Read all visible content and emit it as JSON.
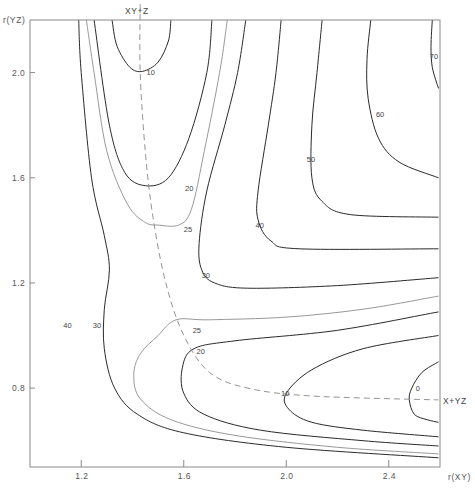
{
  "chart_data": {
    "type": "contour",
    "title": "",
    "xlabel": "r(XY)",
    "ylabel": "r(YZ)",
    "xlim": [
      1.0,
      2.6
    ],
    "ylim": [
      0.5,
      2.2
    ],
    "grid": false,
    "legend": null,
    "x_ticks": [
      {
        "value": 1.2,
        "label": "1.2"
      },
      {
        "value": 1.6,
        "label": "1.6"
      },
      {
        "value": 2.0,
        "label": "2.0"
      },
      {
        "value": 2.4,
        "label": "2.4"
      }
    ],
    "y_ticks": [
      {
        "value": 2.0,
        "label": "2.0"
      },
      {
        "value": 1.6,
        "label": "1.6"
      },
      {
        "value": 1.2,
        "label": "1.2"
      },
      {
        "value": 0.8,
        "label": "0.8"
      }
    ],
    "contour_levels": [
      0,
      10,
      20,
      25,
      30,
      40,
      50,
      60,
      70
    ],
    "contours": [
      {
        "level": "70",
        "style": "dark",
        "label_pos": [
          2.56,
          2.05
        ],
        "points": [
          [
            2.57,
            2.2
          ],
          [
            2.565,
            2.1
          ],
          [
            2.57,
            2.02
          ],
          [
            2.594,
            1.94
          ]
        ]
      },
      {
        "level": "60",
        "style": "dark",
        "label_pos": [
          2.35,
          1.83
        ],
        "points": [
          [
            2.33,
            2.2
          ],
          [
            2.315,
            2.05
          ],
          [
            2.32,
            1.9
          ],
          [
            2.36,
            1.75
          ],
          [
            2.44,
            1.66
          ],
          [
            2.594,
            1.6
          ]
        ]
      },
      {
        "level": "50",
        "style": "dark",
        "label_pos": [
          2.08,
          1.66
        ],
        "points": [
          [
            2.14,
            2.2
          ],
          [
            2.12,
            2.0
          ],
          [
            2.1,
            1.8
          ],
          [
            2.1,
            1.6
          ],
          [
            2.14,
            1.51
          ],
          [
            2.25,
            1.46
          ],
          [
            2.594,
            1.45
          ]
        ]
      },
      {
        "level": "40",
        "style": "dark",
        "label_pos": [
          1.88,
          1.41
        ],
        "points": [
          [
            1.98,
            2.2
          ],
          [
            1.96,
            2.0
          ],
          [
            1.93,
            1.8
          ],
          [
            1.89,
            1.55
          ],
          [
            1.89,
            1.44
          ],
          [
            1.94,
            1.36
          ],
          [
            2.05,
            1.33
          ],
          [
            2.594,
            1.33
          ]
        ]
      },
      {
        "level": "30",
        "style": "dark",
        "label_pos": [
          1.67,
          1.22
        ],
        "points": [
          [
            1.842,
            2.2
          ],
          [
            1.81,
            2.0
          ],
          [
            1.76,
            1.8
          ],
          [
            1.69,
            1.55
          ],
          [
            1.66,
            1.35
          ],
          [
            1.67,
            1.25
          ],
          [
            1.72,
            1.2
          ],
          [
            1.85,
            1.18
          ],
          [
            2.2,
            1.19
          ],
          [
            2.594,
            1.22
          ]
        ],
        "lower_branch": [
          [
            1.19,
            2.2
          ],
          [
            1.2,
            2.0
          ],
          [
            1.24,
            1.6
          ],
          [
            1.29,
            1.38
          ],
          [
            1.31,
            1.25
          ],
          [
            1.29,
            1.1
          ],
          [
            1.29,
            0.95
          ],
          [
            1.33,
            0.8
          ],
          [
            1.42,
            0.7
          ],
          [
            1.6,
            0.63
          ],
          [
            2.0,
            0.575
          ],
          [
            2.594,
            0.535
          ]
        ]
      },
      {
        "level": "25",
        "style": "light",
        "label_pos": [
          1.635,
          1.01
        ],
        "points": [
          [
            1.77,
            2.2
          ],
          [
            1.74,
            2.0
          ],
          [
            1.68,
            1.7
          ],
          [
            1.63,
            1.48
          ],
          [
            1.58,
            1.42
          ],
          [
            1.5,
            1.42
          ]
        ],
        "left_branch": [
          [
            1.22,
            2.2
          ],
          [
            1.25,
            2.0
          ],
          [
            1.3,
            1.7
          ],
          [
            1.38,
            1.5
          ],
          [
            1.45,
            1.43
          ],
          [
            1.5,
            1.42
          ]
        ],
        "lower_branch": [
          [
            2.594,
            1.15
          ],
          [
            2.3,
            1.1
          ],
          [
            2.0,
            1.07
          ],
          [
            1.7,
            1.06
          ],
          [
            1.57,
            1.06
          ],
          [
            1.5,
            1.0
          ],
          [
            1.43,
            0.93
          ],
          [
            1.405,
            0.85
          ],
          [
            1.43,
            0.76
          ],
          [
            1.55,
            0.68
          ],
          [
            1.8,
            0.62
          ],
          [
            2.2,
            0.575
          ],
          [
            2.594,
            0.55
          ]
        ]
      },
      {
        "level": "20",
        "style": "dark",
        "label_pos": [
          1.605,
          1.55
        ],
        "points": [
          [
            1.71,
            2.2
          ],
          [
            1.69,
            2.0
          ],
          [
            1.62,
            1.75
          ],
          [
            1.54,
            1.6
          ],
          [
            1.45,
            1.57
          ],
          [
            1.37,
            1.62
          ],
          [
            1.31,
            1.8
          ],
          [
            1.25,
            2.2
          ]
        ],
        "lower_branch": [
          [
            2.594,
            1.09
          ],
          [
            2.2,
            1.02
          ],
          [
            1.8,
            0.98
          ],
          [
            1.64,
            0.95
          ],
          [
            1.595,
            0.88
          ],
          [
            1.6,
            0.78
          ],
          [
            1.68,
            0.7
          ],
          [
            1.9,
            0.64
          ],
          [
            2.3,
            0.6
          ],
          [
            2.594,
            0.58
          ]
        ]
      },
      {
        "level": "10",
        "style": "dark",
        "label_pos": [
          1.455,
          1.99
        ],
        "points": [
          [
            1.32,
            2.2
          ],
          [
            1.34,
            2.1
          ],
          [
            1.39,
            2.02
          ],
          [
            1.44,
            2.005
          ],
          [
            1.5,
            2.04
          ],
          [
            1.54,
            2.12
          ],
          [
            1.55,
            2.2
          ]
        ],
        "lower_branch": [
          [
            2.594,
            1.0
          ],
          [
            2.3,
            0.95
          ],
          [
            2.1,
            0.87
          ],
          [
            2.0,
            0.78
          ],
          [
            2.01,
            0.72
          ],
          [
            2.1,
            0.67
          ],
          [
            2.3,
            0.64
          ],
          [
            2.594,
            0.615
          ]
        ]
      },
      {
        "level": "0",
        "style": "dark",
        "label_pos": [
          2.505,
          0.79
        ],
        "points": [
          [
            2.594,
            0.9
          ],
          [
            2.53,
            0.86
          ],
          [
            2.49,
            0.8
          ],
          [
            2.48,
            0.755
          ],
          [
            2.5,
            0.7
          ],
          [
            2.55,
            0.68
          ],
          [
            2.594,
            0.67
          ]
        ]
      }
    ],
    "reaction_path": {
      "style": "dashed",
      "points": [
        [
          1.43,
          2.26
        ],
        [
          1.43,
          2.0
        ],
        [
          1.45,
          1.7
        ],
        [
          1.48,
          1.45
        ],
        [
          1.53,
          1.2
        ],
        [
          1.6,
          1.0
        ],
        [
          1.7,
          0.86
        ],
        [
          1.85,
          0.8
        ],
        [
          2.1,
          0.77
        ],
        [
          2.594,
          0.755
        ]
      ],
      "start_label": "XY+Z",
      "end_label": "X+YZ"
    }
  }
}
